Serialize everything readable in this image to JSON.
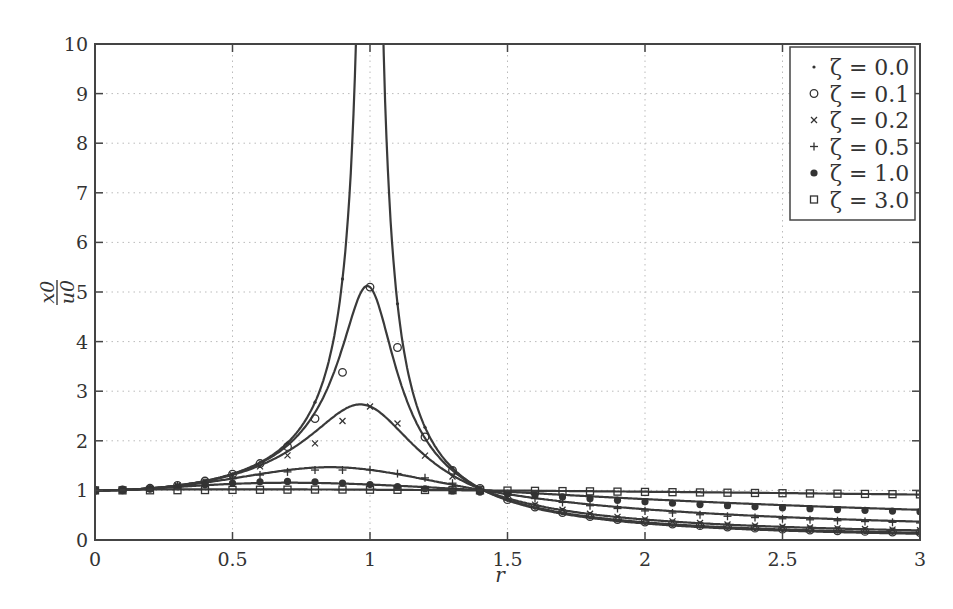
{
  "chart_data": {
    "type": "line",
    "title": "",
    "xlabel": "r",
    "ylabel": "x0/u0",
    "ylabel_num": "x0",
    "ylabel_den": "u0",
    "xlim": [
      0,
      3
    ],
    "ylim": [
      0,
      10
    ],
    "grid": true,
    "legend_position": "upper right",
    "xticks": [
      0,
      0.5,
      1,
      1.5,
      2,
      2.5,
      3
    ],
    "xtick_labels": [
      "0",
      "0.5",
      "1",
      "1.5",
      "2",
      "2.5",
      "3"
    ],
    "yticks": [
      0,
      1,
      2,
      3,
      4,
      5,
      6,
      7,
      8,
      9,
      10
    ],
    "ytick_labels": [
      "0",
      "1",
      "2",
      "3",
      "4",
      "5",
      "6",
      "7",
      "8",
      "9",
      "10"
    ],
    "x": [
      0,
      0.1,
      0.2,
      0.3,
      0.4,
      0.5,
      0.6,
      0.7,
      0.8,
      0.9,
      1.0,
      1.1,
      1.2,
      1.3,
      1.4,
      1.5,
      1.6,
      1.7,
      1.8,
      1.9,
      2.0,
      2.1,
      2.2,
      2.3,
      2.4,
      2.5,
      2.6,
      2.7,
      2.8,
      2.9,
      3.0
    ],
    "series": [
      {
        "name": "ζ = 0.0",
        "marker": "dot",
        "values": [
          1.0,
          1.0101,
          1.0417,
          1.0989,
          1.1905,
          1.3333,
          1.5625,
          1.9608,
          2.7778,
          5.2632,
          null,
          4.7619,
          2.2727,
          1.4493,
          1.0417,
          0.8,
          0.641,
          0.5291,
          0.4464,
          0.3831,
          0.3333,
          0.2933,
          0.2604,
          0.2331,
          0.2101,
          0.1905,
          0.1736,
          0.1589,
          0.1462,
          0.1349,
          0.125
        ]
      },
      {
        "name": "ζ = 0.1",
        "marker": "circle",
        "values": [
          1.0,
          1.0102,
          1.0419,
          1.0987,
          1.1889,
          1.3275,
          1.5409,
          1.8811,
          2.4473,
          3.3799,
          5.099,
          3.8813,
          2.0764,
          1.4038,
          1.0408,
          0.8138,
          0.6624,
          0.5542,
          0.4737,
          0.4116,
          0.3624,
          0.3226,
          0.2898,
          0.2623,
          0.2389,
          0.2189,
          0.2016,
          0.1865,
          0.1732,
          0.1615,
          0.151
        ]
      },
      {
        "name": "ζ = 0.2",
        "marker": "x",
        "values": [
          1.0,
          1.0103,
          1.0422,
          1.0981,
          1.1844,
          1.3107,
          1.4847,
          1.7068,
          1.9484,
          2.4,
          2.6926,
          2.3497,
          1.7012,
          1.2816,
          1.0375,
          0.8477,
          0.7126,
          0.6088,
          0.5291,
          0.4663,
          0.4161,
          0.3753,
          0.3415,
          0.3133,
          0.2893,
          0.2686,
          0.2506,
          0.2349,
          0.221,
          0.2087,
          0.1977
        ]
      },
      {
        "name": "ζ = 0.5",
        "marker": "plus",
        "values": [
          1.0,
          1.0105,
          1.0419,
          1.0926,
          1.1588,
          1.2344,
          1.3103,
          1.3733,
          1.4102,
          1.4109,
          1.4142,
          1.3391,
          1.2526,
          1.1452,
          1.0213,
          0.9244,
          0.8357,
          0.7581,
          0.6915,
          0.6348,
          0.5865,
          0.5452,
          0.5096,
          0.4788,
          0.4519,
          0.4282,
          0.4073,
          0.3887,
          0.3721,
          0.3572,
          0.3437
        ]
      },
      {
        "name": "ζ = 1.0",
        "marker": "filled-circle",
        "values": [
          1.0,
          1.0098,
          1.0365,
          1.0735,
          1.1131,
          1.1481,
          1.1724,
          1.1815,
          1.1733,
          1.1478,
          1.118,
          1.0756,
          1.0329,
          0.9894,
          0.9661,
          0.9384,
          0.9035,
          0.8685,
          0.834,
          0.8008,
          0.7698,
          0.7413,
          0.7151,
          0.6911,
          0.6692,
          0.6491,
          0.6307,
          0.6137,
          0.5981,
          0.5837,
          0.5704
        ]
      },
      {
        "name": "ζ = 3.0",
        "marker": "square",
        "values": [
          1.0,
          1.0005,
          1.002,
          1.0043,
          1.0071,
          1.0101,
          1.0129,
          1.0152,
          1.0166,
          1.017,
          1.0138,
          1.0121,
          1.0085,
          1.0044,
          1.0,
          0.9962,
          0.9913,
          0.9861,
          0.9807,
          0.9752,
          0.9697,
          0.9642,
          0.9588,
          0.9535,
          0.9483,
          0.9432,
          0.9383,
          0.9335,
          0.9289,
          0.9244,
          0.9201
        ]
      }
    ]
  }
}
